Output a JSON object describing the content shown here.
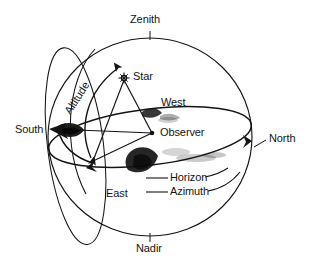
{
  "diagram": {
    "type": "celestial-sphere-horizon-coordinates",
    "title": "",
    "background_color": "#ffffff",
    "ink_color": "#141414",
    "labels": {
      "zenith": "Zenith",
      "nadir": "Nadir",
      "north": "North",
      "south": "South",
      "east": "East",
      "west": "West",
      "star": "Star",
      "observer": "Observer",
      "horizon": "Horizon",
      "azimuth": "Azimuth",
      "altitude": "Altitude"
    },
    "geometry": {
      "sphere_center_x": 150,
      "sphere_center_y": 137,
      "sphere_radius_x": 102,
      "sphere_radius_y": 99,
      "horizon_ellipse_ry": 28,
      "observer_x": 152,
      "observer_y": 133,
      "star_x": 123,
      "star_y": 78,
      "zenith_tick_y": 38,
      "nadir_tick_y": 236
    },
    "elements": [
      "outer-sphere-circle",
      "horizon-ellipse",
      "meridian-ellipse",
      "altitude-arc",
      "azimuth-arc",
      "observer-to-star-line",
      "observer-to-south-line",
      "observer-to-azimuth-point-line",
      "star-glyph",
      "ink-smudges"
    ]
  }
}
